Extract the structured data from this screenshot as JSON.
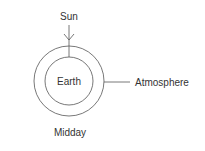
{
  "diagram": {
    "labels": {
      "sun": "Sun",
      "earth": "Earth",
      "atmosphere": "Atmosphere",
      "caption": "Midday"
    },
    "colors": {
      "stroke": "#555555",
      "text": "#333333",
      "background": "#ffffff"
    }
  }
}
